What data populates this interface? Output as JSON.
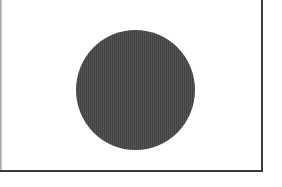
{
  "image": {
    "description": "Solid dark gray circle centered in a white frame",
    "background_color": "#ffffff",
    "frame": {
      "border_color": "#3a3a3a",
      "left_border_color": "#9a9a9a",
      "sides_visible": [
        "left",
        "right",
        "bottom"
      ]
    },
    "shape": {
      "type": "circle",
      "fill_color": "#4a4a4a",
      "center": [
        135,
        90
      ],
      "radius": 60
    }
  }
}
